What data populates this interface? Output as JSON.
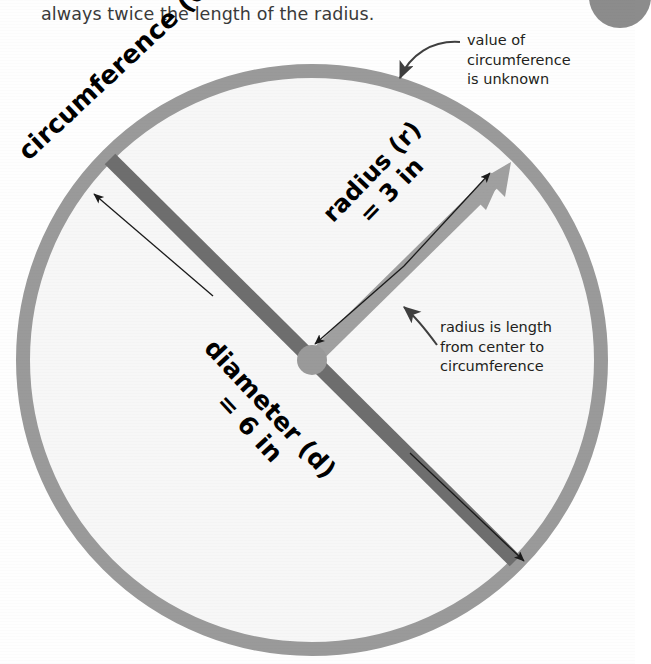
{
  "page": {
    "intro_text": "always twice the length of the radius.",
    "clipped_line_above": "",
    "background_color": "#ffffff"
  },
  "figure": {
    "name": "circle-diagram",
    "colors": {
      "ring": "#9a9a9a",
      "interior": "#f7f7f7",
      "diameter_bar": "#6e6e6e",
      "radius_bar": "#a0a0a0",
      "hub": "#9a9a9a",
      "thin_arrow": "#1a1a1a",
      "text": "#231f20"
    },
    "geometry": {
      "center_x": 312,
      "center_y": 360,
      "outer_radius": 296,
      "ring_thickness": 14
    },
    "labels": {
      "circumference": "circumference (C)",
      "radius_line1": "radius (r)",
      "radius_line2": "= 3 in",
      "diameter_line1": "diameter (d)",
      "diameter_line2": "= 6 in"
    },
    "callouts": {
      "circumference_note": "value of circumference is unknown",
      "circumference_note_lines": [
        "value of",
        "circumference",
        "is unknown"
      ],
      "radius_note": "radius is length from center to circumference",
      "radius_note_lines": [
        "radius is length",
        "from center to",
        "circumference"
      ]
    },
    "values": {
      "radius": "3 in",
      "diameter": "6 in",
      "circumference": "unknown"
    }
  }
}
